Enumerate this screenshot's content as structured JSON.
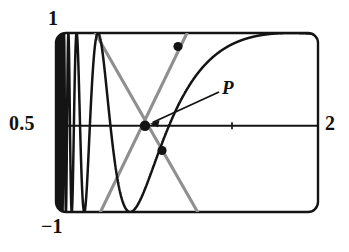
{
  "figure": {
    "kind": "calculator-plot",
    "frame": {
      "x": 56,
      "y": 33,
      "width": 262,
      "height": 179,
      "corner_radius": 10
    },
    "stroke_color": "#141414",
    "secant_color": "#8f8f8f",
    "axis_color": "#141414",
    "background": "#ffffff"
  },
  "labels": {
    "y_max": "1",
    "y_axis_value": "0.5",
    "y_min": "−1",
    "x_max": "2",
    "point": "P"
  },
  "chart_data": {
    "type": "line",
    "title": "",
    "xlabel": "",
    "ylabel": "",
    "xlim": [
      0,
      2
    ],
    "ylim": [
      -1,
      1
    ],
    "axis_y_value": 0.5,
    "grid": false,
    "legend": false,
    "tick_labels": {
      "y": [
        "1",
        "0.5",
        "−1"
      ],
      "x": [
        "2"
      ]
    },
    "x_axis_tick_marks": [
      1.35
    ],
    "series": [
      {
        "name": "oscillating-curve",
        "description": "rapidly oscillating curve, wavelength increasing to the right, amplitude 1",
        "color": "#141414",
        "points_x": [
          0.0,
          0.02,
          0.04,
          0.06,
          0.08,
          0.1,
          0.12,
          0.14,
          0.16,
          0.18,
          0.2,
          0.24,
          0.28,
          0.32,
          0.36,
          0.4,
          0.46,
          0.52,
          0.58,
          0.64,
          0.7,
          0.78,
          0.86,
          0.94,
          1.02,
          1.1,
          1.2,
          1.3,
          1.4,
          1.5,
          1.6,
          1.7,
          1.8,
          1.9,
          2.0
        ],
        "points_y": [
          1,
          -1,
          1,
          -1,
          1,
          -1,
          1,
          -1,
          1,
          -1,
          1,
          -1,
          1,
          -1,
          1,
          -1,
          1,
          -1,
          1,
          -1,
          1,
          -1,
          1,
          -1,
          1,
          -1,
          1,
          -0.2,
          1,
          0.4,
          -1,
          -0.6,
          1,
          0.2,
          -1
        ]
      },
      {
        "name": "secant-line-descending",
        "description": "gray line from upper-left through P down to lower-right",
        "color": "#8f8f8f",
        "x0": 0.3,
        "y0": 1.0,
        "x1": 1.08,
        "y1": -1.0
      },
      {
        "name": "secant-line-ascending",
        "description": "gray line from lower-left through P up to upper-right",
        "color": "#8f8f8f",
        "x0": 0.34,
        "y0": -1.0,
        "x1": 1.0,
        "y1": 1.0
      }
    ],
    "markers": [
      {
        "name": "point-P",
        "x": 0.68,
        "y": 0.5,
        "radius": 5.0,
        "color": "#141414"
      },
      {
        "name": "point-upper",
        "x": 0.93,
        "y": 0.89,
        "radius": 4.5,
        "color": "#141414"
      },
      {
        "name": "point-lower",
        "x": 0.81,
        "y": 0.22,
        "radius": 4.5,
        "color": "#141414"
      }
    ],
    "annotations": [
      {
        "text": "P",
        "x": 1.26,
        "y": 0.76,
        "arrow_to_x": 0.7,
        "arrow_to_y": 0.52
      }
    ]
  }
}
